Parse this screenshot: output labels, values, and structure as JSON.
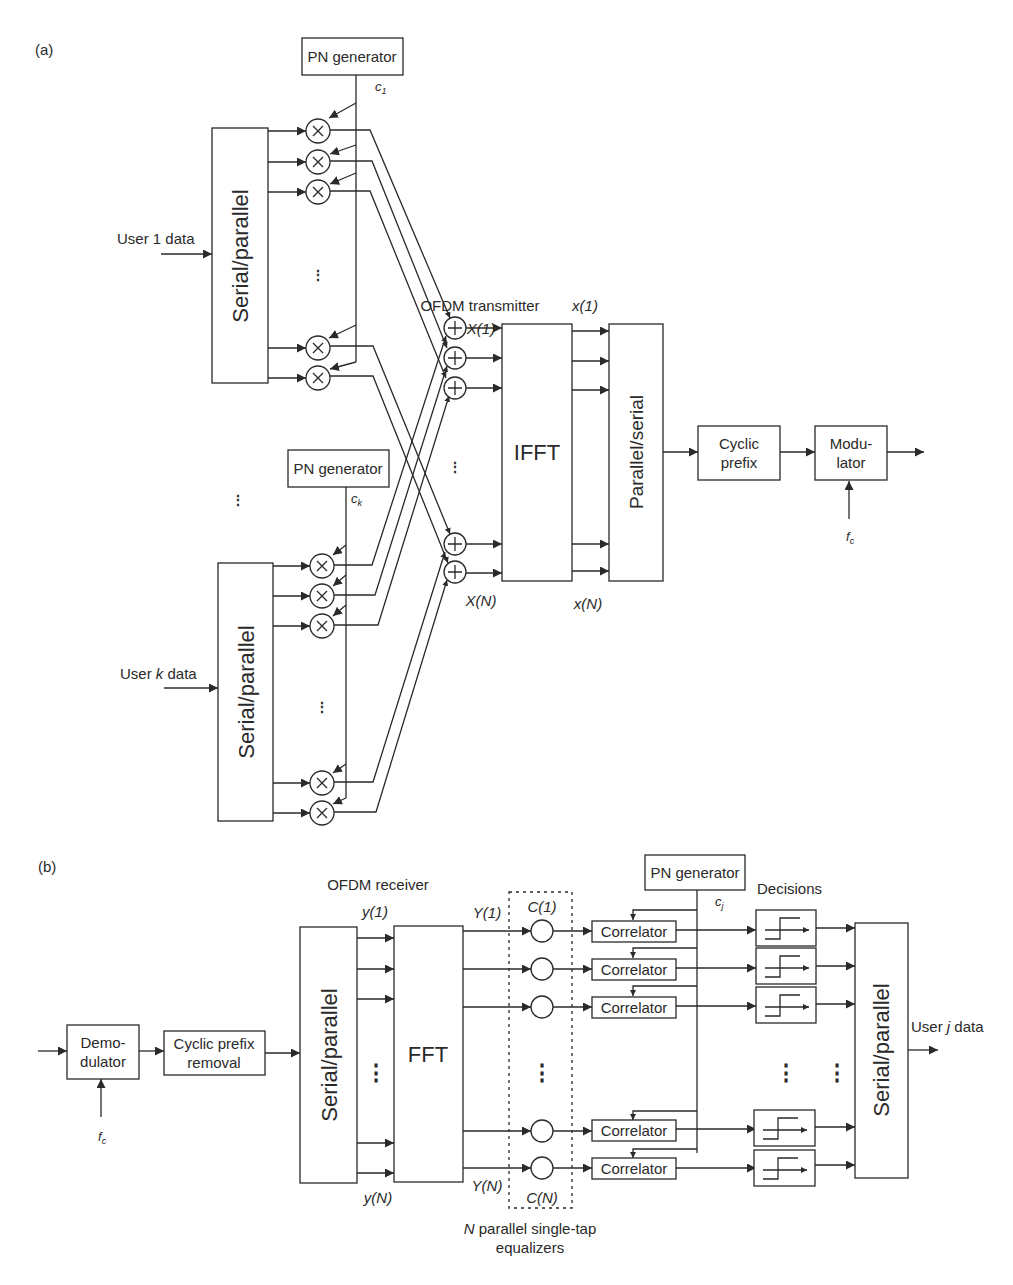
{
  "panel_a": {
    "label": "(a)",
    "section_title": "OFDM transmitter",
    "user1": {
      "input_label": "User 1 data",
      "sp_block": "Serial/parallel",
      "pn_block": "PN generator",
      "code": "c",
      "code_sub": "1",
      "multiplier_symbol": "×"
    },
    "userk": {
      "input_label_pre": "User ",
      "input_label_var": "k",
      "input_label_post": " data",
      "sp_block": "Serial/parallel",
      "pn_block": "PN generator",
      "code": "c",
      "code_sub": "k",
      "multiplier_symbol": "×"
    },
    "adder_symbol": "+",
    "freq_labels": {
      "first": "X(1)",
      "last": "X(N)"
    },
    "time_labels": {
      "first": "x(1)",
      "last": "x(N)"
    },
    "ifft_block": "IFFT",
    "ps_block": "Parallel/serial",
    "cp_block": [
      "Cyclic",
      "prefix"
    ],
    "mod_block": [
      "Modu-",
      "lator"
    ],
    "carrier": "f",
    "carrier_sub": "c",
    "ellipsis": "⋮"
  },
  "panel_b": {
    "label": "(b)",
    "section_title": "OFDM receiver",
    "demod_block": [
      "Demo-",
      "dulator"
    ],
    "carrier": "f",
    "carrier_sub": "c",
    "cp_removal_block": [
      "Cyclic prefix",
      "removal"
    ],
    "sp_block": "Serial/parallel",
    "fft_block": "FFT",
    "time_labels": {
      "first": "y(1)",
      "last": "y(N)"
    },
    "freq_labels": {
      "first": "Y(1)",
      "last": "Y(N)"
    },
    "eq_labels": {
      "first": "C(1)",
      "last": "C(N)"
    },
    "eq_caption_var": "N",
    "eq_caption_line1": " parallel single-tap",
    "eq_caption_line2": "equalizers",
    "pn_block": "PN generator",
    "code": "c",
    "code_sub": "j",
    "correlator": "Correlator",
    "decisions_title": "Decisions",
    "ps_block": "Serial/parallel",
    "output_pre": "User ",
    "output_var": "j",
    "output_post": " data",
    "ellipsis": "⋮"
  }
}
